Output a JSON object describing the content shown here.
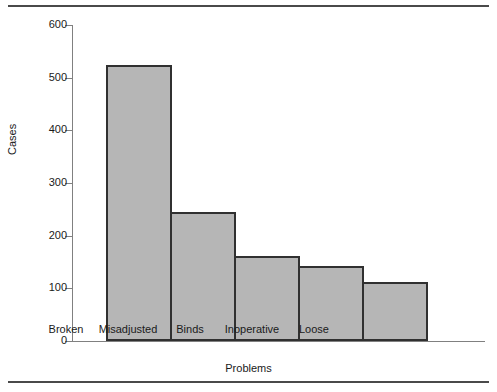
{
  "chart_data": {
    "type": "bar",
    "title": "",
    "categories": [
      "Broken",
      "Misadjusted",
      "Binds",
      "Inoperative",
      "Loose"
    ],
    "values": [
      525,
      245,
      162,
      143,
      112
    ],
    "xlabel": "Problems",
    "ylabel": "Cases",
    "ylim": [
      0,
      600
    ],
    "yticks": [
      0,
      100,
      200,
      300,
      400,
      500,
      600
    ],
    "ytick_labels": [
      "0",
      "100",
      "200",
      "300",
      "400",
      "500",
      "600"
    ],
    "grid": false,
    "legend": false,
    "bar_fill_color": "#b6b6b6",
    "bar_edge_color": "#303030",
    "axis_color": "#808080",
    "text_color": "#1a1a1a",
    "rule_color": "#4a4a4a"
  }
}
